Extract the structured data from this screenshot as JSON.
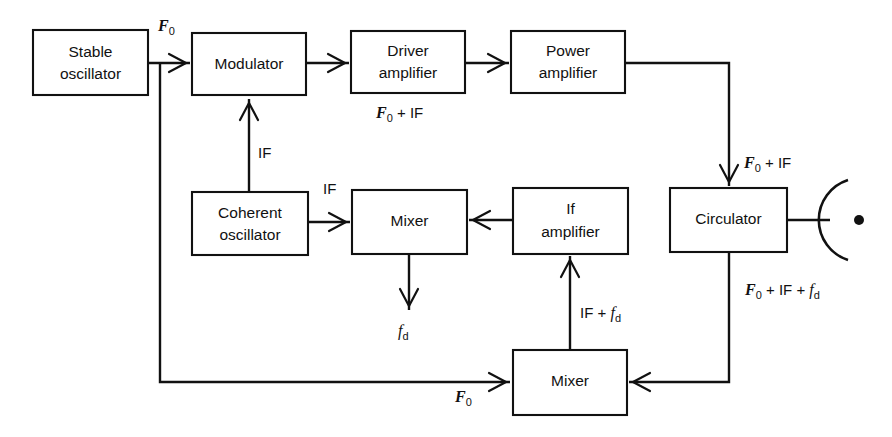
{
  "diagram": {
    "stroke_color": "#111111",
    "background_color": "#ffffff",
    "blocks": [
      {
        "id": "stable-oscillator",
        "line1": "Stable",
        "line2": "oscillator",
        "x": 33,
        "y": 30,
        "w": 115,
        "h": 65
      },
      {
        "id": "modulator",
        "line1": "Modulator",
        "line2": "",
        "x": 192,
        "y": 33,
        "w": 114,
        "h": 62
      },
      {
        "id": "driver-amplifier",
        "line1": "Driver",
        "line2": "amplifier",
        "x": 351,
        "y": 31,
        "w": 114,
        "h": 62
      },
      {
        "id": "power-amplifier",
        "line1": "Power",
        "line2": "amplifier",
        "x": 511,
        "y": 31,
        "w": 114,
        "h": 62
      },
      {
        "id": "coherent-oscillator",
        "line1": "Coherent",
        "line2": "oscillator",
        "x": 192,
        "y": 192,
        "w": 116,
        "h": 63
      },
      {
        "id": "mixer-middle",
        "line1": "Mixer",
        "line2": "",
        "x": 352,
        "y": 190,
        "w": 115,
        "h": 64
      },
      {
        "id": "if-amplifier",
        "line1": "If",
        "line2": "amplifier",
        "x": 513,
        "y": 188,
        "w": 115,
        "h": 66
      },
      {
        "id": "circulator",
        "line1": "Circulator",
        "line2": "",
        "x": 670,
        "y": 188,
        "w": 117,
        "h": 64
      },
      {
        "id": "mixer-bottom",
        "line1": "Mixer",
        "line2": "",
        "x": 513,
        "y": 350,
        "w": 114,
        "h": 65
      }
    ],
    "signal_labels": [
      {
        "id": "f0-top",
        "text": "F0",
        "base": "F",
        "sub": "0",
        "suffix": "",
        "x": 158,
        "y": 31,
        "style": "italic-bold"
      },
      {
        "id": "if-modulator",
        "text": "IF",
        "base": "",
        "sub": "",
        "suffix": "IF",
        "x": 258,
        "y": 152,
        "style": "plain"
      },
      {
        "id": "f0-plus-if-driver",
        "text": "F0 + IF",
        "base": "F",
        "sub": "0",
        "suffix": " + IF",
        "x": 376,
        "y": 115,
        "style": "italic-bold"
      },
      {
        "id": "f0-plus-if-circ",
        "text": "F0 + IF",
        "base": "F",
        "sub": "0",
        "suffix": " + IF",
        "x": 742,
        "y": 163,
        "style": "italic-bold"
      },
      {
        "id": "if-coherent",
        "text": "IF",
        "base": "",
        "sub": "",
        "suffix": "IF",
        "x": 325,
        "y": 188,
        "style": "plain"
      },
      {
        "id": "fd-doppler",
        "text": "fd",
        "base": "f",
        "sub": "d",
        "suffix": "",
        "x": 398,
        "y": 330,
        "style": "italic"
      },
      {
        "id": "if-plus-fd",
        "text": "IF + fd",
        "base": "",
        "sub": "d",
        "suffix": "",
        "x": 578,
        "y": 312,
        "style": "mixed"
      },
      {
        "id": "f0-if-fd-return",
        "text": "F0 + IF + fd",
        "base": "F",
        "sub": "0",
        "suffix": " + IF + ",
        "x": 745,
        "y": 290,
        "style": "italic-bold"
      },
      {
        "id": "f0-bottom-mixer",
        "text": "F0",
        "base": "F",
        "sub": "0",
        "suffix": "",
        "x": 463,
        "y": 396,
        "style": "italic-bold"
      }
    ],
    "antenna": {
      "id": "parabolic-antenna",
      "cx": 826,
      "cy": 220,
      "radius": 42
    }
  }
}
